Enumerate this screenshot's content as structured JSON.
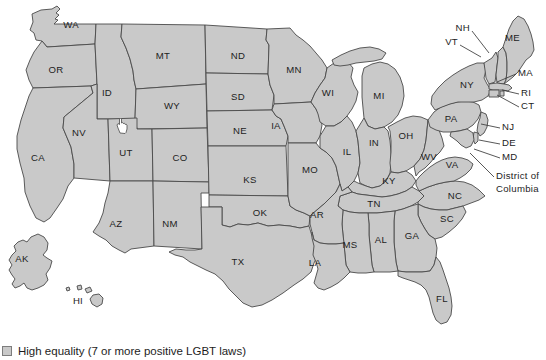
{
  "map": {
    "title": "United States LGBT equality map",
    "fill_color": "#c9c9c9",
    "border_color": "#4a4a4a",
    "water_color": "#ffffff",
    "label_color": "#1d1d1d",
    "states": [
      {
        "code": "WA",
        "name": "Washington",
        "lx": 71,
        "ly": 25
      },
      {
        "code": "OR",
        "name": "Oregon",
        "lx": 56,
        "ly": 70
      },
      {
        "code": "ID",
        "name": "Idaho",
        "lx": 107,
        "ly": 93
      },
      {
        "code": "MT",
        "name": "Montana",
        "lx": 163,
        "ly": 56
      },
      {
        "code": "WY",
        "name": "Wyoming",
        "lx": 172,
        "ly": 106
      },
      {
        "code": "ND",
        "name": "North Dakota",
        "lx": 238,
        "ly": 56
      },
      {
        "code": "SD",
        "name": "South Dakota",
        "lx": 238,
        "ly": 97
      },
      {
        "code": "NE",
        "name": "Nebraska",
        "lx": 240,
        "ly": 131
      },
      {
        "code": "KS",
        "name": "Kansas",
        "lx": 250,
        "ly": 180
      },
      {
        "code": "MN",
        "name": "Minnesota",
        "lx": 294,
        "ly": 70
      },
      {
        "code": "IA",
        "name": "Iowa",
        "lx": 276,
        "ly": 126
      },
      {
        "code": "MO",
        "name": "Missouri",
        "lx": 310,
        "ly": 170
      },
      {
        "code": "WI",
        "name": "Wisconsin",
        "lx": 328,
        "ly": 93
      },
      {
        "code": "IL",
        "name": "Illinois",
        "lx": 347,
        "ly": 152
      },
      {
        "code": "MI",
        "name": "Michigan",
        "lx": 379,
        "ly": 96
      },
      {
        "code": "IN",
        "name": "Indiana",
        "lx": 374,
        "ly": 143
      },
      {
        "code": "OH",
        "name": "Ohio",
        "lx": 406,
        "ly": 136
      },
      {
        "code": "KY",
        "name": "Kentucky",
        "lx": 389,
        "ly": 181
      },
      {
        "code": "TN",
        "name": "Tennessee",
        "lx": 374,
        "ly": 204
      },
      {
        "code": "WV",
        "name": "West Virginia",
        "lx": 429,
        "ly": 157
      },
      {
        "code": "VA",
        "name": "Virginia",
        "lx": 452,
        "ly": 165
      },
      {
        "code": "NC",
        "name": "North Carolina",
        "lx": 455,
        "ly": 196
      },
      {
        "code": "SC",
        "name": "South Carolina",
        "lx": 447,
        "ly": 219
      },
      {
        "code": "GA",
        "name": "Georgia",
        "lx": 412,
        "ly": 236
      },
      {
        "code": "AL",
        "name": "Alabama",
        "lx": 381,
        "ly": 240
      },
      {
        "code": "MS",
        "name": "Mississippi",
        "lx": 350,
        "ly": 245
      },
      {
        "code": "AR",
        "name": "Arkansas",
        "lx": 317,
        "ly": 215
      },
      {
        "code": "LA",
        "name": "Louisiana",
        "lx": 315,
        "ly": 263
      },
      {
        "code": "FL",
        "name": "Florida",
        "lx": 442,
        "ly": 299
      },
      {
        "code": "OK",
        "name": "Oklahoma",
        "lx": 260,
        "ly": 213
      },
      {
        "code": "TX",
        "name": "Texas",
        "lx": 238,
        "ly": 262
      },
      {
        "code": "NM",
        "name": "NM",
        "lx": 170,
        "ly": 224
      },
      {
        "code": "AZ",
        "name": "Arizona",
        "lx": 116,
        "ly": 224
      },
      {
        "code": "CO",
        "name": "Colorado",
        "lx": 180,
        "ly": 158
      },
      {
        "code": "UT",
        "name": "Utah",
        "lx": 126,
        "ly": 153
      },
      {
        "code": "NV",
        "name": "Nevada",
        "lx": 79,
        "ly": 133
      },
      {
        "code": "CA",
        "name": "California",
        "lx": 38,
        "ly": 158
      },
      {
        "code": "AK",
        "name": "Alaska",
        "lx": 22,
        "ly": 259
      },
      {
        "code": "HI",
        "name": "Hawaii",
        "lx": 78,
        "ly": 301
      },
      {
        "code": "PA",
        "name": "Pennsylvania",
        "lx": 451,
        "ly": 119
      },
      {
        "code": "NY",
        "name": "New York",
        "lx": 467,
        "ly": 85
      }
    ],
    "callouts": [
      {
        "code": "NH",
        "name": "New Hampshire",
        "tx": 455,
        "ty": 28,
        "anchor": "start",
        "line": [
          [
            472,
            31
          ],
          [
            489,
            53
          ]
        ]
      },
      {
        "code": "VT",
        "name": "Vermont",
        "tx": 443,
        "ty": 42,
        "anchor": "start",
        "line": [
          [
            460,
            45
          ],
          [
            481,
            57
          ]
        ]
      },
      {
        "code": "ME",
        "name": "Maine",
        "tx": 505,
        "ty": 38,
        "anchor": "start",
        "line": null
      },
      {
        "code": "MA",
        "name": "Massachusetts",
        "tx": 518,
        "ty": 73,
        "anchor": "start",
        "line": [
          [
            516,
            74
          ],
          [
            497,
            82
          ]
        ]
      },
      {
        "code": "RI",
        "name": "Rhode Island",
        "tx": 521,
        "ty": 93,
        "anchor": "start",
        "line": [
          [
            519,
            94
          ],
          [
            502,
            90
          ]
        ]
      },
      {
        "code": "CT",
        "name": "Connecticut",
        "tx": 521,
        "ty": 106,
        "anchor": "start",
        "line": [
          [
            519,
            107
          ],
          [
            497,
            95
          ]
        ]
      },
      {
        "code": "NJ",
        "name": "New Jersey",
        "tx": 502,
        "ty": 127,
        "anchor": "start",
        "line": [
          [
            500,
            128
          ],
          [
            481,
            124
          ]
        ]
      },
      {
        "code": "DE",
        "name": "Delaware",
        "tx": 502,
        "ty": 143,
        "anchor": "start",
        "line": [
          [
            500,
            144
          ],
          [
            479,
            140
          ]
        ]
      },
      {
        "code": "MD",
        "name": "Maryland",
        "tx": 502,
        "ty": 157,
        "anchor": "start",
        "line": [
          [
            500,
            158
          ],
          [
            474,
            149
          ]
        ]
      },
      {
        "code": "District of Columbia",
        "name": "District of Columbia",
        "tx": 496,
        "ty": 176,
        "anchor": "start",
        "line": [
          [
            494,
            177
          ],
          [
            470,
            153
          ]
        ]
      }
    ]
  },
  "legend": {
    "swatch_color": "#c9c9c9",
    "label": "High equality (7 or more positive LGBT laws)"
  },
  "cursor": {
    "icon": "hand-pointer-cursor",
    "x": 116,
    "y": 117
  }
}
